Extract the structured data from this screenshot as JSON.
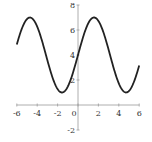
{
  "chart_data": {
    "type": "line",
    "title": "",
    "xlabel": "",
    "ylabel": "",
    "function": "y = 3 sin(x) + 4",
    "xlim": [
      -6,
      6
    ],
    "ylim": [
      -2,
      8
    ],
    "grid": false,
    "x_ticks": [
      -6,
      -4,
      -2,
      0,
      2,
      4,
      6
    ],
    "x_tick_labels": [
      "-6",
      "-4",
      "-2",
      "0",
      "2",
      "4",
      "6"
    ],
    "y_ticks": [
      -2,
      2,
      4,
      6,
      8
    ],
    "y_tick_labels": [
      "-2",
      "2",
      "4",
      "6",
      "8"
    ],
    "series": [
      {
        "name": "curve",
        "color": "#222222",
        "x": [
          -6,
          -5,
          -4,
          -3,
          -2,
          -1,
          0,
          1,
          2,
          3,
          4,
          5,
          6
        ],
        "y": [
          4.84,
          6.88,
          6.27,
          3.58,
          1.27,
          1.48,
          4.0,
          6.52,
          6.73,
          4.42,
          1.73,
          1.12,
          3.16
        ]
      }
    ]
  }
}
